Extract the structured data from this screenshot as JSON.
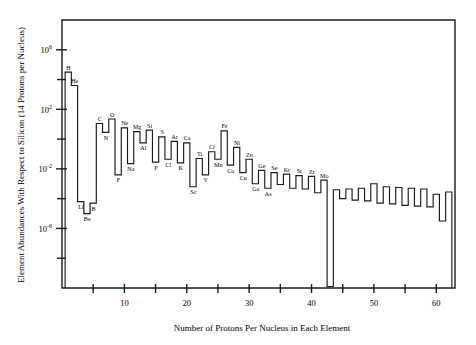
{
  "chart_data": {
    "type": "line",
    "subtype": "step-histogram",
    "title": "",
    "xlabel": "Number of Protons Per Nucleus in Each Element",
    "ylabel": "Element Abundances With Respect to Silicon (14 Protons per Nucleus)",
    "xlim": [
      0,
      63
    ],
    "ylim_log10": [
      -10,
      8
    ],
    "yscale": "log",
    "grid": false,
    "legend": null,
    "x_ticks_major": [
      10,
      20,
      30,
      40,
      50,
      60
    ],
    "x_ticks_minor": [
      5,
      15,
      25,
      35,
      45,
      55
    ],
    "x_tick_labels": [
      "10",
      "20",
      "30",
      "40",
      "50",
      "60"
    ],
    "y_ticks_labeled_log10": [
      6,
      2,
      -2,
      -6
    ],
    "y_tick_labels": [
      "10^6",
      "10^2",
      "10^-2",
      "10^-6"
    ],
    "y_tick_mantissa": [
      "10",
      "10",
      "10",
      "10"
    ],
    "y_tick_exponent": [
      "6",
      "2",
      "-2",
      "-6"
    ],
    "y_ticks_minor_log10": [
      4,
      0,
      -4,
      -8
    ],
    "x": [
      1,
      2,
      3,
      4,
      5,
      6,
      7,
      8,
      9,
      10,
      11,
      12,
      13,
      14,
      15,
      16,
      17,
      18,
      19,
      20,
      21,
      22,
      23,
      24,
      25,
      26,
      27,
      28,
      29,
      30,
      31,
      32,
      33,
      34,
      35,
      36,
      37,
      38,
      39,
      40,
      41,
      42,
      43,
      44,
      45,
      46,
      47,
      48,
      49,
      50,
      51,
      52,
      53,
      54,
      55,
      56,
      57,
      58,
      59,
      60,
      61,
      62
    ],
    "values_log10": [
      4.5,
      3.6,
      -4.2,
      -5.0,
      -4.3,
      1.05,
      0.45,
      1.35,
      -2.4,
      0.75,
      -1.65,
      0.5,
      -0.25,
      0.6,
      -1.55,
      0.15,
      -1.35,
      -0.15,
      -1.6,
      -0.25,
      -3.2,
      -1.3,
      -2.4,
      -0.85,
      -1.35,
      0.55,
      -1.75,
      -0.55,
      -2.25,
      -1.35,
      -3.0,
      -2.1,
      -3.3,
      -2.25,
      -3.05,
      -2.35,
      -3.3,
      -2.45,
      -3.35,
      -2.5,
      -3.6,
      -2.75,
      -9.9,
      -3.4,
      -4.0,
      -3.35,
      -4.1,
      -3.3,
      -4.15,
      -3.0,
      -4.3,
      -3.2,
      -4.35,
      -3.25,
      -4.45,
      -3.3,
      -4.5,
      -3.35,
      -4.55,
      -3.7,
      -5.5,
      -3.55
    ],
    "element_labels": [
      {
        "z": 1,
        "symbol": "H"
      },
      {
        "z": 2,
        "symbol": "He"
      },
      {
        "z": 3,
        "symbol": "Li"
      },
      {
        "z": 4,
        "symbol": "Be"
      },
      {
        "z": 5,
        "symbol": "B"
      },
      {
        "z": 6,
        "symbol": "C"
      },
      {
        "z": 7,
        "symbol": "N"
      },
      {
        "z": 8,
        "symbol": "O"
      },
      {
        "z": 9,
        "symbol": "F"
      },
      {
        "z": 10,
        "symbol": "Ne"
      },
      {
        "z": 11,
        "symbol": "Na"
      },
      {
        "z": 12,
        "symbol": "Mg"
      },
      {
        "z": 13,
        "symbol": "Al"
      },
      {
        "z": 14,
        "symbol": "Si"
      },
      {
        "z": 15,
        "symbol": "P"
      },
      {
        "z": 16,
        "symbol": "S"
      },
      {
        "z": 17,
        "symbol": "Cl"
      },
      {
        "z": 18,
        "symbol": "Ar"
      },
      {
        "z": 19,
        "symbol": "K"
      },
      {
        "z": 20,
        "symbol": "Ca"
      },
      {
        "z": 21,
        "symbol": "Sc"
      },
      {
        "z": 22,
        "symbol": "Ti"
      },
      {
        "z": 23,
        "symbol": "V"
      },
      {
        "z": 24,
        "symbol": "Cr"
      },
      {
        "z": 25,
        "symbol": "Mn"
      },
      {
        "z": 26,
        "symbol": "Fe"
      },
      {
        "z": 27,
        "symbol": "Co"
      },
      {
        "z": 28,
        "symbol": "Ni"
      },
      {
        "z": 29,
        "symbol": "Cu"
      },
      {
        "z": 30,
        "symbol": "Zn"
      },
      {
        "z": 31,
        "symbol": "Ga"
      },
      {
        "z": 32,
        "symbol": "Ge"
      },
      {
        "z": 33,
        "symbol": "As"
      },
      {
        "z": 34,
        "symbol": "Se"
      },
      {
        "z": 36,
        "symbol": "Kr"
      },
      {
        "z": 38,
        "symbol": "Sr"
      },
      {
        "z": 40,
        "symbol": "Zr"
      },
      {
        "z": 42,
        "symbol": "Mo"
      }
    ]
  },
  "colors": {
    "ink": "#1a1a1a",
    "background": "#ffffff"
  }
}
